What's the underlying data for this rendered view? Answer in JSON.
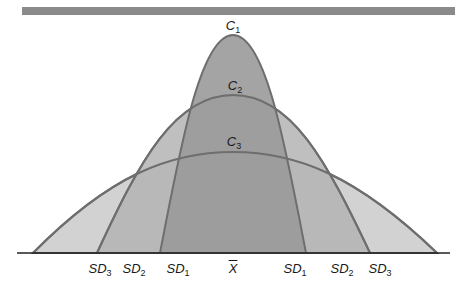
{
  "diagram": {
    "type": "overlapping normal distribution curves",
    "colors": {
      "top_bar": "#8a8a8a",
      "outline": "#6e6e6e",
      "fill_c3_outer": "#d2d2d2",
      "fill_c2_band": "#b4b4b4",
      "fill_c1_center": "#9a9a9a",
      "baseline": "#222222"
    },
    "curves": [
      {
        "id": "C1",
        "label_base": "C",
        "label_sub": "1",
        "peak_x": 233,
        "peak_y": 35,
        "left_x": 160,
        "right_x": 306
      },
      {
        "id": "C2",
        "label_base": "C",
        "label_sub": "2",
        "peak_x": 233,
        "peak_y": 95,
        "left_x": 97,
        "right_x": 370
      },
      {
        "id": "C3",
        "label_base": "C",
        "label_sub": "3",
        "peak_x": 233,
        "peak_y": 152,
        "left_x": 33,
        "right_x": 437
      }
    ],
    "axis_labels": [
      {
        "base": "SD",
        "sub": "3",
        "x": 100
      },
      {
        "base": "SD",
        "sub": "2",
        "x": 135
      },
      {
        "base": "SD",
        "sub": "1",
        "x": 178
      },
      {
        "base": "X",
        "sub": "",
        "x": 233,
        "overline": true
      },
      {
        "base": "SD",
        "sub": "1",
        "x": 295
      },
      {
        "base": "SD",
        "sub": "2",
        "x": 342
      },
      {
        "base": "SD",
        "sub": "3",
        "x": 380
      }
    ]
  }
}
